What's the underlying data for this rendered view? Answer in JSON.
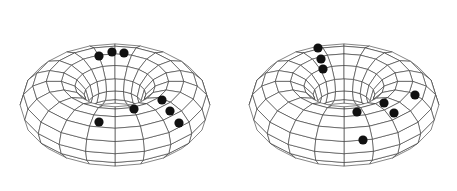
{
  "figure": {
    "background": "#ffffff",
    "line_color": "#333333",
    "dot_color": "#111111",
    "panels": [
      {
        "id": "torus-left",
        "center": [
          115,
          99
        ],
        "outer_rx": 98,
        "outer_ry": 74,
        "inner_rx": 36,
        "inner_ry": 21,
        "inner_cy_offset": -13,
        "dots": [
          [
            99,
            56
          ],
          [
            112,
            52
          ],
          [
            124,
            53
          ],
          [
            134,
            109
          ],
          [
            99,
            122
          ],
          [
            162,
            100
          ],
          [
            170,
            111
          ],
          [
            179,
            123
          ]
        ]
      },
      {
        "id": "torus-right",
        "center": [
          344,
          99
        ],
        "outer_rx": 98,
        "outer_ry": 74,
        "inner_rx": 36,
        "inner_ry": 21,
        "inner_cy_offset": -13,
        "dots": [
          [
            318,
            48
          ],
          [
            321,
            59
          ],
          [
            323,
            69
          ],
          [
            357,
            112
          ],
          [
            384,
            103
          ],
          [
            394,
            113
          ],
          [
            415,
            95
          ],
          [
            363,
            140
          ]
        ]
      }
    ]
  }
}
